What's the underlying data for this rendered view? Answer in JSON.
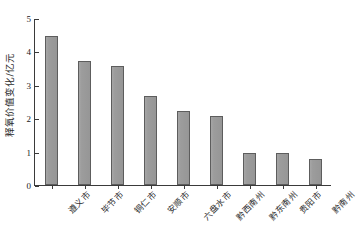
{
  "chart_data": {
    "type": "bar",
    "title": "",
    "xlabel": "",
    "ylabel": "释氧价值变化/亿元",
    "ylim": [
      0,
      5
    ],
    "yticks": [
      0,
      1,
      2,
      3,
      4,
      5
    ],
    "ytick_labels": [
      "0",
      "1",
      "2",
      "3",
      "4",
      "5"
    ],
    "grid": false,
    "legend": null,
    "categories": [
      "遵义市",
      "毕节市",
      "铜仁市",
      "安顺市",
      "六盘水市",
      "黔西南州",
      "黔东南州",
      "贵阳市",
      "黔南州"
    ],
    "values": [
      4.45,
      3.7,
      3.55,
      2.68,
      2.22,
      2.08,
      0.96,
      0.96,
      0.78
    ],
    "series": [
      {
        "name": "释氧价值变化",
        "values": [
          4.45,
          3.7,
          3.55,
          2.68,
          2.22,
          2.08,
          0.96,
          0.96,
          0.78
        ]
      }
    ],
    "colors": {
      "bar_fill": "#9c9c9c",
      "bar_border": "#5d5d5d",
      "axis": "#3a3a3a",
      "text": "#2b2b2b",
      "background": "#ffffff"
    }
  }
}
